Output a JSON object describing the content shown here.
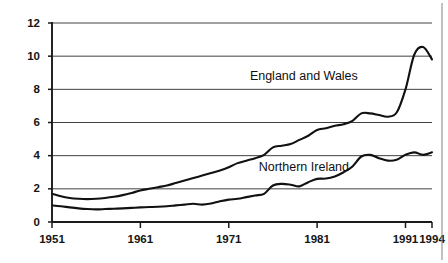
{
  "chart_data": {
    "type": "line",
    "title": "",
    "subtitle": "",
    "xlabel": "",
    "ylabel": "",
    "xlim": [
      1951,
      1994
    ],
    "ylim": [
      0,
      12
    ],
    "grid": true,
    "legend_position": "inline-annotation",
    "y_ticks": [
      0,
      2,
      4,
      6,
      8,
      10,
      12
    ],
    "y_tick_labels": [
      "0",
      "2",
      "4",
      "6",
      "8",
      "10",
      "12"
    ],
    "x_ticks": [
      1951,
      1961,
      1971,
      1981,
      1991,
      1994
    ],
    "x_tick_labels": [
      "1951",
      "1961",
      "1971",
      "1981",
      "1991",
      "1994"
    ],
    "annotations": [
      {
        "text": "England and Wales",
        "x": 1979.5,
        "y": 8.55
      },
      {
        "text": "Northern Ireland",
        "x": 1979.5,
        "y": 3.05
      }
    ],
    "series": [
      {
        "name": "England and Wales",
        "color": "#111111",
        "x": [
          1951,
          1952,
          1953,
          1954,
          1955,
          1956,
          1957,
          1958,
          1959,
          1960,
          1961,
          1962,
          1963,
          1964,
          1965,
          1966,
          1967,
          1968,
          1969,
          1970,
          1971,
          1972,
          1973,
          1974,
          1975,
          1976,
          1977,
          1978,
          1979,
          1980,
          1981,
          1982,
          1983,
          1984,
          1985,
          1986,
          1987,
          1988,
          1989,
          1990,
          1991,
          1992,
          1993,
          1994
        ],
        "values": [
          1.7,
          1.55,
          1.45,
          1.4,
          1.38,
          1.4,
          1.45,
          1.52,
          1.62,
          1.75,
          1.9,
          2.0,
          2.1,
          2.2,
          2.35,
          2.5,
          2.65,
          2.8,
          2.95,
          3.1,
          3.3,
          3.55,
          3.7,
          3.85,
          4.05,
          4.5,
          4.6,
          4.7,
          4.95,
          5.2,
          5.55,
          5.65,
          5.8,
          5.9,
          6.1,
          6.55,
          6.55,
          6.45,
          6.35,
          6.6,
          8.0,
          10.1,
          10.55,
          9.8
        ]
      },
      {
        "name": "Northern Ireland",
        "color": "#111111",
        "x": [
          1951,
          1952,
          1953,
          1954,
          1955,
          1956,
          1957,
          1958,
          1959,
          1960,
          1961,
          1962,
          1963,
          1964,
          1965,
          1966,
          1967,
          1968,
          1969,
          1970,
          1971,
          1972,
          1973,
          1974,
          1975,
          1976,
          1977,
          1978,
          1979,
          1980,
          1981,
          1982,
          1983,
          1984,
          1985,
          1986,
          1987,
          1988,
          1989,
          1990,
          1991,
          1992,
          1993,
          1994
        ],
        "values": [
          1.0,
          0.95,
          0.88,
          0.82,
          0.78,
          0.76,
          0.78,
          0.8,
          0.82,
          0.85,
          0.88,
          0.9,
          0.92,
          0.95,
          1.0,
          1.05,
          1.1,
          1.05,
          1.12,
          1.25,
          1.35,
          1.4,
          1.5,
          1.6,
          1.7,
          2.2,
          2.3,
          2.25,
          2.15,
          2.4,
          2.6,
          2.62,
          2.75,
          3.0,
          3.35,
          3.95,
          4.05,
          3.85,
          3.7,
          3.75,
          4.05,
          4.2,
          4.05,
          4.2
        ]
      }
    ]
  },
  "geometry": {
    "plot_left": 52,
    "plot_right": 432,
    "plot_top": 23,
    "plot_bottom": 222
  }
}
